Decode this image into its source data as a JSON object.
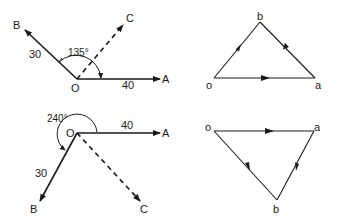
{
  "figure": {
    "top_vector_diagram": {
      "origin_label": "O",
      "vector_a": {
        "label": "A",
        "magnitude_label": "40"
      },
      "vector_b": {
        "label": "B",
        "magnitude_label": "30"
      },
      "vector_c": {
        "label": "C"
      },
      "angle_label": "135°"
    },
    "bottom_vector_diagram": {
      "origin_label": "O",
      "vector_a": {
        "label": "A",
        "magnitude_label": "40"
      },
      "vector_b": {
        "label": "B",
        "magnitude_label": "30"
      },
      "vector_c": {
        "label": "C"
      },
      "angle_label": "240°"
    },
    "top_triangle": {
      "vertex_o": "o",
      "vertex_a": "a",
      "vertex_b": "b"
    },
    "bottom_triangle": {
      "vertex_o": "o",
      "vertex_a": "a",
      "vertex_b": "b"
    }
  }
}
